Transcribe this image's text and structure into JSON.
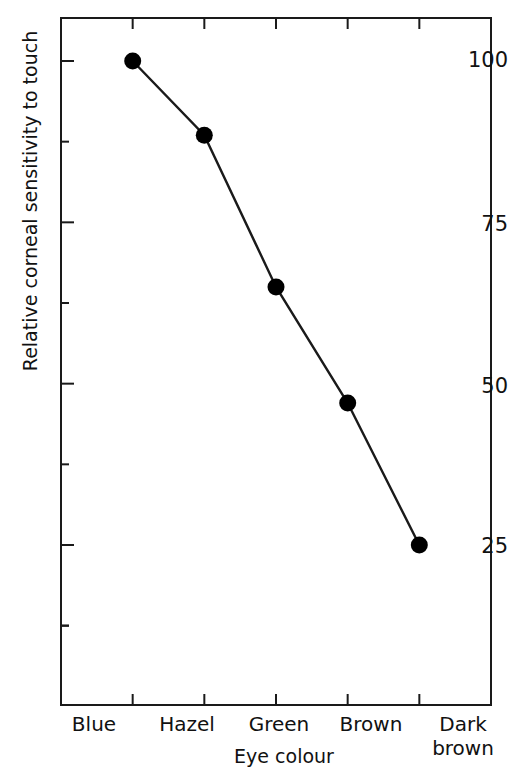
{
  "chart_data": {
    "type": "line",
    "title": "",
    "subtitle": "",
    "xlabel": "Eye colour",
    "ylabel": "Relative corneal sensitivity to touch",
    "categories": [
      "Blue",
      "Hazel",
      "Green",
      "Brown",
      "Dark brown"
    ],
    "values": [
      100,
      88.5,
      65,
      47,
      25
    ],
    "series": [
      {
        "name": "Relative corneal sensitivity to touch",
        "values": [
          100,
          88.5,
          65,
          47,
          25
        ]
      }
    ],
    "ylim": [
      0,
      106
    ],
    "xlim": [
      0,
      6
    ],
    "yticks_major": [
      25,
      50,
      75,
      100
    ],
    "yticks_minor": [
      12.5,
      37.5,
      62.5,
      87.5
    ],
    "ytick_labels": [
      "25",
      "50",
      "75",
      "100"
    ],
    "xtick_labels": [
      "Blue",
      "Hazel",
      "Green",
      "Brown",
      "Dark brown"
    ],
    "grid": false,
    "legend": "none",
    "marker": "filled-circle",
    "marker_color": "#000000",
    "line_color": "#1a1a1a",
    "axis_color": "#1a1a1a",
    "background": "#ffffff"
  },
  "axes": {
    "y_title": "Relative corneal sensitivity to touch",
    "x_title": "Eye colour",
    "y_labels": [
      {
        "text": "100",
        "top": 50
      },
      {
        "text": "75",
        "top": 214
      },
      {
        "text": "50",
        "top": 376
      },
      {
        "text": "25",
        "top": 536
      }
    ],
    "x_labels": [
      {
        "line1": "Blue",
        "line2": "",
        "left": 39
      },
      {
        "line1": "Hazel",
        "line2": "",
        "left": 132
      },
      {
        "line1": "Green",
        "line2": "",
        "left": 224
      },
      {
        "line1": "Brown",
        "line2": "",
        "left": 316
      },
      {
        "line1": "Dark",
        "line2": "brown",
        "left": 408
      }
    ]
  }
}
